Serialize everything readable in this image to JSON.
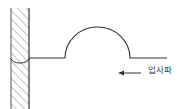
{
  "diagram": {
    "type": "wave-pulse-reflection",
    "wave_label": "입사파",
    "arrow_direction": "left",
    "colors": {
      "stroke": "#333333",
      "hatch": "#888888",
      "background": "#ffffff"
    },
    "elements": {
      "wall": "hatched fixed wall",
      "string": "horizontal string attached to wall",
      "pulse": "semicircular pulse",
      "arrow": "left-pointing arrow"
    }
  }
}
